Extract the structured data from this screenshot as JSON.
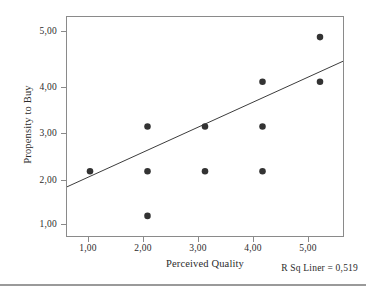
{
  "chart_data": {
    "type": "scatter",
    "title": "",
    "xlabel": "Perceived Quality",
    "ylabel": "Propensity to Buy",
    "xlim": [
      0.6,
      5.4
    ],
    "ylim": [
      0.55,
      5.45
    ],
    "xticks": [
      1,
      2,
      3,
      4,
      5
    ],
    "yticks": [
      1,
      2,
      3,
      4,
      5
    ],
    "xticklabels": [
      "1,00",
      "2,00",
      "3,00",
      "4,00",
      "5,00"
    ],
    "yticklabels": [
      "1,00",
      "2,00",
      "3,00",
      "4,00",
      "5,00"
    ],
    "grid": false,
    "legend": null,
    "marker_color": "#333333",
    "line_color": "#3a3a3a",
    "frame_color": "#8a8a8a",
    "points": [
      {
        "x": 1,
        "y": 2
      },
      {
        "x": 2,
        "y": 1
      },
      {
        "x": 2,
        "y": 2
      },
      {
        "x": 2,
        "y": 3
      },
      {
        "x": 3,
        "y": 2
      },
      {
        "x": 3,
        "y": 3
      },
      {
        "x": 4,
        "y": 2
      },
      {
        "x": 4,
        "y": 3
      },
      {
        "x": 4,
        "y": 4
      },
      {
        "x": 5,
        "y": 4
      },
      {
        "x": 5,
        "y": 5
      }
    ],
    "fit_line": {
      "x_start": 0.6,
      "y_start": 1.65,
      "x_end": 5.4,
      "y_end": 4.46
    },
    "annotations": [
      {
        "name": "r-squared-label",
        "text": "R Sq Liner = 0,519",
        "value": "0,519"
      }
    ]
  }
}
